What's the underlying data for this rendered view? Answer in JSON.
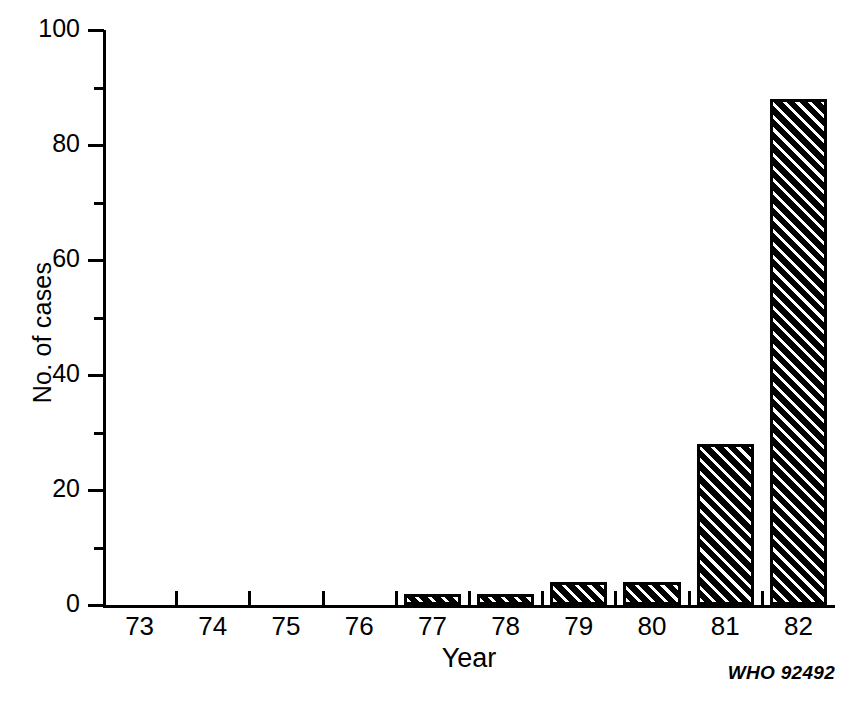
{
  "chart_data": {
    "type": "bar",
    "title": "",
    "subtitle": "",
    "xlabel": "Year",
    "ylabel": "No. of cases",
    "categories": [
      "73",
      "74",
      "75",
      "76",
      "77",
      "78",
      "79",
      "80",
      "81",
      "82"
    ],
    "values": [
      0,
      0,
      0,
      0,
      2,
      2,
      4,
      4,
      28,
      88
    ],
    "series": [
      {
        "name": "No. of cases",
        "values": [
          0,
          0,
          0,
          0,
          2,
          2,
          4,
          4,
          28,
          88
        ]
      }
    ],
    "ylim": [
      0,
      100
    ],
    "y_major_ticks": [
      0,
      20,
      40,
      60,
      80,
      100
    ],
    "y_minor_ticks": [
      10,
      30,
      50,
      70,
      90
    ],
    "y_tick_labels": [
      "0",
      "20",
      "40",
      "60",
      "80",
      "100"
    ],
    "grid": false,
    "legend": false,
    "legend_position": "none",
    "bar_fill": "diagonal-hatch-black",
    "bar_color": "#000000",
    "background_color": "#ffffff",
    "annotations": [
      "WHO 92492"
    ]
  },
  "figure": {
    "credit": "WHO 92492"
  }
}
